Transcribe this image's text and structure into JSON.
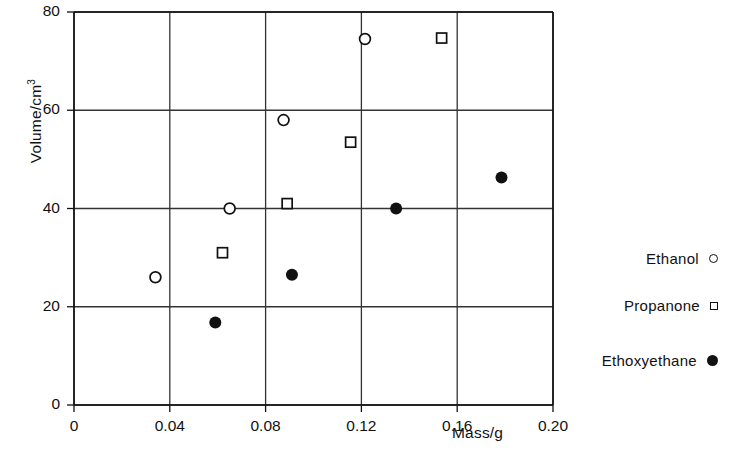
{
  "chart_data": {
    "type": "scatter",
    "title": "",
    "xlabel": "Mass/g",
    "ylabel": "Volume/cm3",
    "ylabel_base": "Volume/cm",
    "ylabel_exponent": "3",
    "xlim": [
      0,
      0.2
    ],
    "ylim": [
      0,
      80
    ],
    "xticks": [
      "0",
      "0.04",
      "0.08",
      "0.12",
      "0.16",
      "0.20"
    ],
    "xtick_values": [
      0,
      0.04,
      0.08,
      0.12,
      0.16,
      0.2
    ],
    "yticks": [
      "0",
      "20",
      "40",
      "60",
      "80"
    ],
    "ytick_values": [
      0,
      20,
      40,
      60,
      80
    ],
    "grid": true,
    "legend_position": "right",
    "series": [
      {
        "name": "Ethanol",
        "marker": "open-circle",
        "color": "#111111",
        "points": [
          {
            "x": 0.034,
            "y": 26.0
          },
          {
            "x": 0.065,
            "y": 40.0
          },
          {
            "x": 0.0875,
            "y": 58.0
          },
          {
            "x": 0.1215,
            "y": 74.5
          }
        ]
      },
      {
        "name": "Propanone",
        "marker": "open-square",
        "color": "#111111",
        "points": [
          {
            "x": 0.062,
            "y": 31.0
          },
          {
            "x": 0.089,
            "y": 41.0
          },
          {
            "x": 0.1155,
            "y": 53.5
          },
          {
            "x": 0.1535,
            "y": 74.7
          }
        ]
      },
      {
        "name": "Ethoxyethane",
        "marker": "filled-circle",
        "color": "#111111",
        "points": [
          {
            "x": 0.059,
            "y": 16.8
          },
          {
            "x": 0.091,
            "y": 26.5
          },
          {
            "x": 0.1345,
            "y": 40.0
          },
          {
            "x": 0.1785,
            "y": 46.3
          }
        ]
      }
    ]
  },
  "legend": {
    "entries": [
      {
        "label": "Ethanol",
        "marker": "open-circle"
      },
      {
        "label": "Propanone",
        "marker": "open-square"
      },
      {
        "label": "Ethoxyethane",
        "marker": "filled-circle"
      }
    ]
  },
  "colors": {
    "axis": "#111111",
    "grid": "#333333",
    "marker": "#111111",
    "background": "#ffffff"
  }
}
